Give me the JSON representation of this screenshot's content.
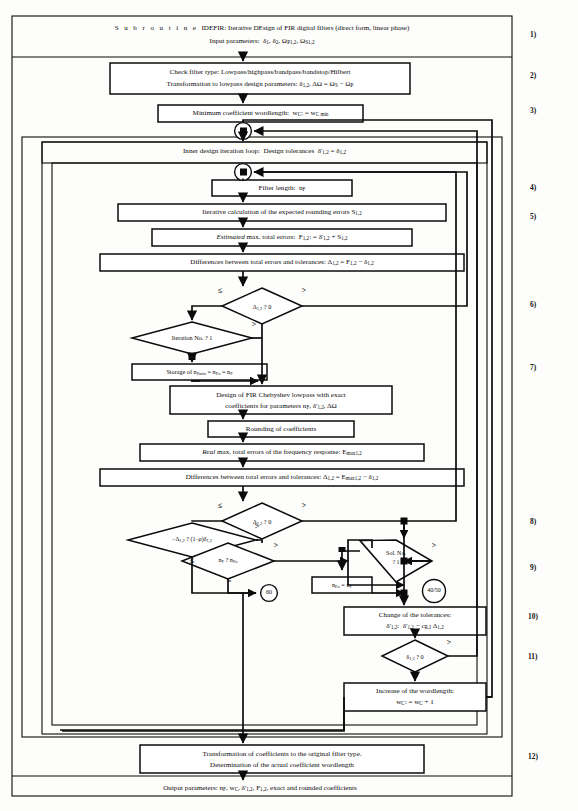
{
  "document": {
    "kind": "flowchart",
    "title_line1_prefix": "Subroutine",
    "title_line1": "S u b r o u t i n e   IDEFIR:  Iterative DEsign of FIR digital filters (direct form, linear phase)",
    "title_line2": "Input parameters:  δ1, δ2, ΩP1,2, ΩS1,2"
  },
  "header_block": {
    "line1_plain": "S u b r o u t i n e",
    "line1_rest": "IDEFIR:  Iterative DEsign of FIR digital filters (direct form, linear phase)",
    "line2_label": "Input parameters:",
    "line2_params": "δ1, δ2, ΩP1,2, ΩS1,2"
  },
  "steps": [
    {
      "n": "1)",
      "name": "input-parameters"
    },
    {
      "n": "2)",
      "name": "check-filter-type"
    },
    {
      "n": "3)",
      "name": "minimum-wordlength"
    },
    {
      "n": "4)",
      "name": "filter-length"
    },
    {
      "n": "5)",
      "name": "rounding-errors"
    },
    {
      "n": "6)",
      "name": "delta-test-estimated"
    },
    {
      "n": "7)",
      "name": "storage-nf"
    },
    {
      "n": "8)",
      "name": "delta-test-real"
    },
    {
      "n": "9)",
      "name": "solution-number"
    },
    {
      "n": "10)",
      "name": "change-tolerances"
    },
    {
      "n": "11)",
      "name": "delta-zero-test"
    },
    {
      "n": "12)",
      "name": "transformation"
    }
  ],
  "boxes": {
    "check_filter": {
      "line1": "Check filter type:  Lowpass/highpass/bandpass/bandstop/Hilbert",
      "line2": "Transformation to lowpass design parameters: δ1,2, ΔΩ = ΩS − ΩP"
    },
    "min_wordlength": "Minimum coefficient wordlength:  wC: = wC min",
    "inner_loop": "Inner design iteration loop:  Design tolerances  δ'1,2 = δ1,2",
    "filter_length": "Filter length:  nF",
    "rounding_errors": "Iterative calculation of the expected rounding errors S1,2",
    "estimated_errors_em": "Estimated",
    "estimated_errors_rest": "max. total errors:  F1,2: = δ'1,2 + S1,2",
    "differences_1": "Differences between total errors and tolerances: Δ1,2 = F1,2 − δ1,2",
    "storage": "Storage of nFmin = nFo = nF",
    "design_cheby_l1": "Design of FIR Chebyshev lowpass with exact",
    "design_cheby_l2": "coefficients for parameters nF, δ'1,2, ΔΩ",
    "rounding_coeff": "Rounding of coefficients",
    "real_errors_em": "Real",
    "real_errors_rest": "max. total errors of the frequency response: Emax1,2",
    "differences_2": "Differences between total errors and tolerances: Δ1,2 = Emax1,2 − δ1,2",
    "nfo_assign": "nFo = nF",
    "change_tolerances_l1": "Change of the tolerances:",
    "change_tolerances_l2": "δ'1,2:  δ'1,2 − cR,I Δ1,2",
    "increase_wordlength_l1": "Increase of the wordlength:",
    "increase_wordlength_l2": "wC: = wC + 1",
    "transformation_l1": "Transformation of coefficients to the original filter type.",
    "transformation_l2": "Determination of the actual coefficient wordlength",
    "output_params": "Output parameters: nF, wC, δ'1,2, F1,2, exact and rounded coefficients"
  },
  "decisions": {
    "d_estimated": {
      "text": "Δ1,2 ? 0",
      "left": "≤",
      "right": ">"
    },
    "d_iteration": {
      "text": "Iteration No. ? 1",
      "right": ">",
      "bottom": "="
    },
    "d_real": {
      "text": "Δ1,2 ? 0",
      "left": "≤",
      "right": ">"
    },
    "d_rho": {
      "text": "−Δ1,2 ? (1−ρ)δ1,2",
      "right": ">",
      "bottom": "≤"
    },
    "d_nf": {
      "text": "nF ? nFo",
      "right": ">",
      "bottom": "≤"
    },
    "d_sol": {
      "line1": "Sol. No.",
      "line2": "? 1",
      "left": "=",
      "right": ">"
    },
    "d_delta_zero": {
      "text": "δ1,2 ? 0",
      "right": ">",
      "bottom": "≤"
    }
  },
  "connectors": [
    {
      "label": "10",
      "name": "connector-10"
    },
    {
      "label": "20",
      "name": "connector-20"
    },
    {
      "label": "60",
      "name": "connector-60"
    },
    {
      "label": "40/50",
      "name": "connector-40-50"
    }
  ],
  "colors": {
    "ink": "#0b0b0b",
    "paper": "#fdfdfb"
  }
}
